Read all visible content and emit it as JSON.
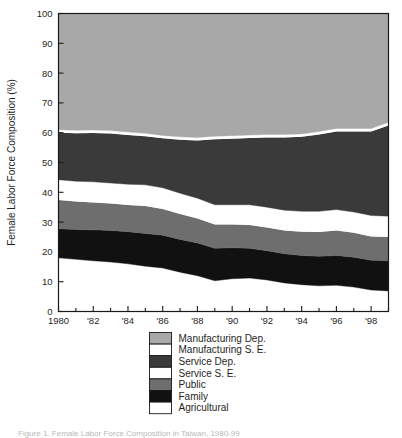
{
  "figure": {
    "caption": "Figure 1. Female Labor Force Composition in Taiwan, 1980-99"
  },
  "chart_data": {
    "type": "area",
    "title": "",
    "xlabel": "",
    "ylabel": "Female Labor Force Composition (%)",
    "ylim": [
      0,
      100
    ],
    "xlim": [
      1980,
      1999
    ],
    "yticks": [
      0,
      10,
      20,
      30,
      40,
      50,
      60,
      70,
      80,
      90,
      100
    ],
    "ytick_labels": [
      "0",
      "10",
      "20",
      "30",
      "40",
      "50",
      "60",
      "70",
      "80",
      "90",
      "100"
    ],
    "xticks": [
      1980,
      1982,
      1984,
      1986,
      1988,
      1990,
      1992,
      1994,
      1996,
      1998
    ],
    "xtick_labels": [
      "1980",
      "'82",
      "'84",
      "'86",
      "'88",
      "'90",
      "'92",
      "'94",
      "'96",
      "'98"
    ],
    "minor_xticks_every": 1,
    "grid": false,
    "stacked": true,
    "stack_order_bottom_to_top": [
      "Agricultural",
      "Family",
      "Public",
      "Service S. E.",
      "Service Dep.",
      "Manufacturing S. E.",
      "Manufacturing Dep."
    ],
    "x": [
      1980,
      1981,
      1982,
      1983,
      1984,
      1985,
      1986,
      1987,
      1988,
      1989,
      1990,
      1991,
      1992,
      1993,
      1994,
      1995,
      1996,
      1997,
      1998,
      1999
    ],
    "series": [
      {
        "name": "Agricultural",
        "color": "#ffffff",
        "values": [
          18.0,
          17.5,
          17.0,
          16.6,
          16.0,
          15.2,
          14.6,
          13.2,
          12.0,
          10.3,
          11.0,
          11.2,
          10.6,
          9.6,
          9.0,
          8.6,
          8.8,
          8.2,
          7.2,
          6.9
        ]
      },
      {
        "name": "Family",
        "color": "#111111",
        "values": [
          9.8,
          10.0,
          10.4,
          10.6,
          10.8,
          11.0,
          11.0,
          11.0,
          11.0,
          10.9,
          10.4,
          10.0,
          9.8,
          9.8,
          9.8,
          9.9,
          10.0,
          10.0,
          10.0,
          10.1
        ]
      },
      {
        "name": "Public",
        "color": "#6e6e6e",
        "values": [
          9.6,
          9.4,
          9.2,
          9.0,
          8.9,
          9.2,
          8.8,
          8.5,
          8.2,
          8.0,
          7.8,
          7.8,
          7.8,
          7.8,
          8.0,
          8.2,
          8.4,
          8.2,
          8.0,
          8.0
        ]
      },
      {
        "name": "Service S. E.",
        "color": "#ffffff",
        "values": [
          6.8,
          6.8,
          6.9,
          6.9,
          7.0,
          7.1,
          7.1,
          7.0,
          6.8,
          6.6,
          6.6,
          6.8,
          6.8,
          6.8,
          6.8,
          6.9,
          7.0,
          7.0,
          7.0,
          7.0
        ]
      },
      {
        "name": "Service Dep.",
        "color": "#3a3a3a",
        "values": [
          15.8,
          16.1,
          16.4,
          16.6,
          16.5,
          16.3,
          16.6,
          17.9,
          19.4,
          22.0,
          22.2,
          22.4,
          23.4,
          24.4,
          25.0,
          25.8,
          26.2,
          27.0,
          28.2,
          30.4
        ]
      },
      {
        "name": "Manufacturing S. E.",
        "color": "#ffffff",
        "values": [
          1.0,
          1.0,
          1.0,
          1.0,
          1.0,
          1.0,
          1.0,
          1.0,
          1.0,
          1.0,
          1.0,
          1.0,
          1.0,
          1.0,
          1.0,
          1.0,
          1.0,
          1.0,
          1.0,
          1.1
        ]
      },
      {
        "name": "Manufacturing Dep.",
        "color": "#a8a8a8",
        "values": [
          39.0,
          39.2,
          39.1,
          39.3,
          39.8,
          40.2,
          40.9,
          41.4,
          41.6,
          41.2,
          41.0,
          40.8,
          40.6,
          40.6,
          40.4,
          39.6,
          38.6,
          38.6,
          38.6,
          36.5
        ]
      }
    ],
    "legend": {
      "position": "bottom-center",
      "entries": [
        {
          "label": "Manufacturing Dep.",
          "color": "#a8a8a8"
        },
        {
          "label": "Manufacturing S. E.",
          "color": "#ffffff"
        },
        {
          "label": "Service Dep.",
          "color": "#3a3a3a"
        },
        {
          "label": "Service S. E.",
          "color": "#ffffff"
        },
        {
          "label": "Public",
          "color": "#6e6e6e"
        },
        {
          "label": "Family",
          "color": "#111111"
        },
        {
          "label": "Agricultural",
          "color": "#ffffff"
        }
      ]
    }
  }
}
